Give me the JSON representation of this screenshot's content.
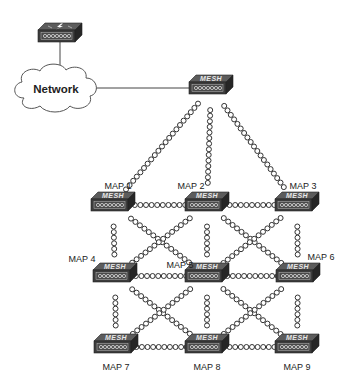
{
  "diagram": {
    "type": "wireless-mesh-topology",
    "cloud": {
      "label": "Network",
      "x": 56,
      "y": 89
    },
    "controller": {
      "name": "wireless-lan-controller",
      "icon": "lightning-bolt",
      "x": 60,
      "y": 32
    },
    "root_ap": {
      "badge": "MESH",
      "x": 211,
      "y": 88
    },
    "maps": [
      {
        "id": "MAP1",
        "label": "MAP 1",
        "x": 113,
        "y": 205,
        "lx": 118,
        "ly": 189,
        "anchor": "middle"
      },
      {
        "id": "MAP2",
        "label": "MAP 2",
        "x": 207,
        "y": 205,
        "lx": 191,
        "ly": 189,
        "anchor": "middle"
      },
      {
        "id": "MAP3",
        "label": "MAP 3",
        "x": 297,
        "y": 205,
        "lx": 303,
        "ly": 189,
        "anchor": "middle"
      },
      {
        "id": "MAP4",
        "label": "MAP 4",
        "x": 115,
        "y": 276,
        "lx": 82,
        "ly": 262,
        "anchor": "middle"
      },
      {
        "id": "MAP5",
        "label": "MAP 5",
        "x": 207,
        "y": 276,
        "lx": 180,
        "ly": 268,
        "anchor": "middle"
      },
      {
        "id": "MAP6",
        "label": "MAP 6",
        "x": 298,
        "y": 276,
        "lx": 321,
        "ly": 260,
        "anchor": "middle"
      },
      {
        "id": "MAP7",
        "label": "MAP 7",
        "x": 116,
        "y": 347,
        "lx": 116,
        "ly": 370,
        "anchor": "middle"
      },
      {
        "id": "MAP8",
        "label": "MAP 8",
        "x": 207,
        "y": 347,
        "lx": 207,
        "ly": 370,
        "anchor": "middle"
      },
      {
        "id": "MAP9",
        "label": "MAP 9",
        "x": 297,
        "y": 347,
        "lx": 297,
        "ly": 370,
        "anchor": "middle"
      }
    ],
    "wired_links": [
      [
        "controller",
        "cloud"
      ],
      [
        "cloud",
        "root_ap"
      ]
    ],
    "wireless_links": [
      [
        "root_ap",
        "MAP1"
      ],
      [
        "root_ap",
        "MAP2"
      ],
      [
        "root_ap",
        "MAP3"
      ],
      [
        "MAP1",
        "MAP2"
      ],
      [
        "MAP2",
        "MAP3"
      ],
      [
        "MAP4",
        "MAP5"
      ],
      [
        "MAP5",
        "MAP6"
      ],
      [
        "MAP7",
        "MAP8"
      ],
      [
        "MAP8",
        "MAP9"
      ],
      [
        "MAP1",
        "MAP4"
      ],
      [
        "MAP4",
        "MAP7"
      ],
      [
        "MAP2",
        "MAP5"
      ],
      [
        "MAP5",
        "MAP8"
      ],
      [
        "MAP3",
        "MAP6"
      ],
      [
        "MAP6",
        "MAP9"
      ],
      [
        "MAP1",
        "MAP5"
      ],
      [
        "MAP2",
        "MAP4"
      ],
      [
        "MAP2",
        "MAP6"
      ],
      [
        "MAP3",
        "MAP5"
      ],
      [
        "MAP4",
        "MAP8"
      ],
      [
        "MAP5",
        "MAP7"
      ],
      [
        "MAP5",
        "MAP9"
      ],
      [
        "MAP6",
        "MAP8"
      ]
    ],
    "colors": {
      "device_top": "#5a5a5a",
      "device_front": "#3a3a3a",
      "device_side": "#2a2a2a",
      "link": "#333333",
      "cloud_fill": "#ffffff",
      "cloud_stroke": "#555555"
    }
  }
}
